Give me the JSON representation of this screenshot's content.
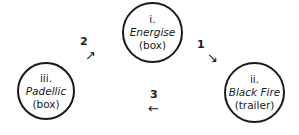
{
  "nodes": [
    {
      "numeral": "i.",
      "title": "Energise",
      "kind": "(box)"
    },
    {
      "numeral": "ii.",
      "title": "Black Fire",
      "kind": "(trailer)"
    },
    {
      "numeral": "iii.",
      "title": "Padellic",
      "kind": "(box)"
    }
  ],
  "edges": [
    {
      "label": "1",
      "arrow": "↘"
    },
    {
      "label": "2",
      "arrow": "↗"
    },
    {
      "label": "3",
      "arrow": "←"
    }
  ]
}
